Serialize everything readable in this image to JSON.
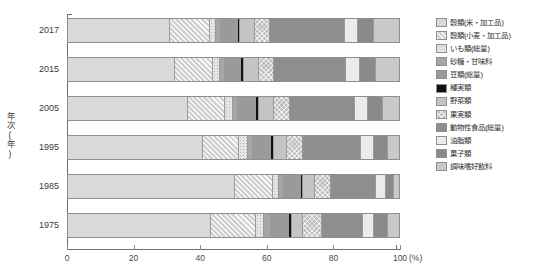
{
  "axes": {
    "y_title": "年次(年)",
    "x_unit": "(%)",
    "x_ticks": [
      0,
      20,
      40,
      60,
      80,
      100
    ],
    "x_tick_labels": [
      "0",
      "20",
      "40",
      "60",
      "80",
      "100"
    ],
    "xlim": [
      0,
      100
    ]
  },
  "legend": {
    "items": [
      {
        "label": "穀類(米・加工品)",
        "color": "#d9d9d9",
        "pattern": "plain"
      },
      {
        "label": "穀類(小麦・加工品)",
        "color": "#cfcfcf",
        "pattern": "diag"
      },
      {
        "label": "いも類(総量)",
        "color": "#e6e6e6",
        "pattern": "dot"
      },
      {
        "label": "砂糖・甘味料",
        "color": "#a6a6a6",
        "pattern": "plain"
      },
      {
        "label": "豆類(総量)",
        "color": "#9a9a9a",
        "pattern": "plain"
      },
      {
        "label": "種実類",
        "color": "#111111",
        "pattern": "plain"
      },
      {
        "label": "野菜類",
        "color": "#c4c4c4",
        "pattern": "plain"
      },
      {
        "label": "果実類",
        "color": "#bdbdbd",
        "pattern": "cross"
      },
      {
        "label": "動物性食品(総量)",
        "color": "#8e8e8e",
        "pattern": "plain"
      },
      {
        "label": "油脂類",
        "color": "#ebebeb",
        "pattern": "plain"
      },
      {
        "label": "菓子類",
        "color": "#8a8a8a",
        "pattern": "plain"
      },
      {
        "label": "調味嗜好飲料",
        "color": "#c9c9c9",
        "pattern": "plain"
      }
    ]
  },
  "chart_data": {
    "type": "bar",
    "orientation": "horizontal",
    "stacked": true,
    "normalized_percent": true,
    "title": "",
    "xlabel": "(%)",
    "ylabel": "年次(年)",
    "xlim": [
      0,
      100
    ],
    "grid": false,
    "legend_position": "right",
    "categories": [
      "2017",
      "2015",
      "2005",
      "1995",
      "1985",
      "1975"
    ],
    "series": [
      {
        "name": "穀類(米・加工品)",
        "values": [
          30.5,
          32.0,
          36.0,
          40.5,
          50.0,
          43.0
        ]
      },
      {
        "name": "穀類(小麦・加工品)",
        "values": [
          12.0,
          11.5,
          11.0,
          11.0,
          11.5,
          13.5
        ]
      },
      {
        "name": "いも類(総量)",
        "values": [
          2.0,
          2.0,
          2.5,
          2.5,
          2.0,
          2.5
        ]
      },
      {
        "name": "砂糖・甘味料",
        "values": [
          1.5,
          1.5,
          1.5,
          1.5,
          1.5,
          2.0
        ]
      },
      {
        "name": "豆類(総量)",
        "values": [
          5.0,
          5.0,
          5.5,
          5.5,
          5.0,
          5.5
        ]
      },
      {
        "name": "種実類",
        "values": [
          0.8,
          0.8,
          0.8,
          0.8,
          0.8,
          0.8
        ]
      },
      {
        "name": "野菜類",
        "values": [
          4.5,
          4.5,
          4.5,
          4.0,
          3.5,
          3.5
        ]
      },
      {
        "name": "果実類",
        "values": [
          4.5,
          4.5,
          5.0,
          5.0,
          5.0,
          5.5
        ]
      },
      {
        "name": "動物性食品(総量)",
        "values": [
          22.5,
          22.0,
          19.5,
          17.5,
          13.5,
          12.5
        ]
      },
      {
        "name": "油脂類",
        "values": [
          4.0,
          4.0,
          4.0,
          4.0,
          3.0,
          3.5
        ]
      },
      {
        "name": "菓子類",
        "values": [
          5.0,
          5.0,
          4.5,
          4.0,
          2.5,
          4.0
        ]
      },
      {
        "name": "調味嗜好飲料",
        "values": [
          7.7,
          7.2,
          5.2,
          3.7,
          1.7,
          3.7
        ]
      }
    ]
  }
}
